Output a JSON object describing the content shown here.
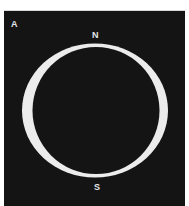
{
  "figure": {
    "panel_label": "A",
    "north_label": "N",
    "south_label": "S",
    "colors": {
      "background": "#141414",
      "ring": "#ececec",
      "text": "#e6e6e6"
    }
  }
}
